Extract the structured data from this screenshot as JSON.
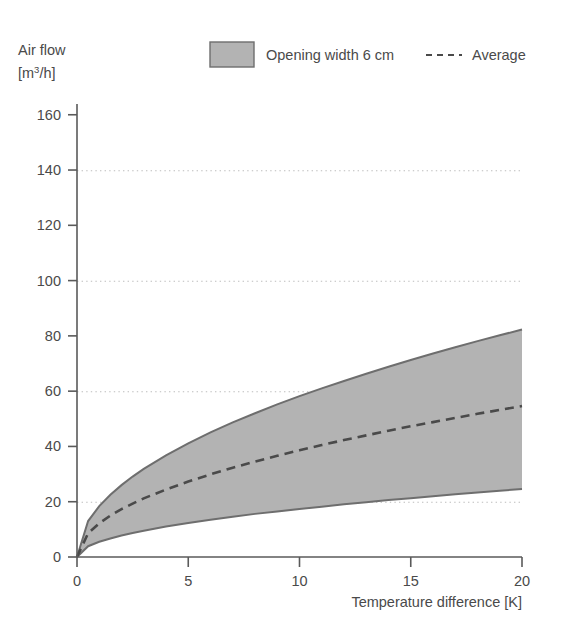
{
  "chart_data": {
    "type": "area",
    "title": "",
    "subtitle": "",
    "ylabel_line1": "Air flow",
    "ylabel_line2_pre": "[m",
    "ylabel_line2_sup": "3",
    "ylabel_line2_post": "/h]",
    "xlabel": "Temperature difference [K]",
    "xlim": [
      0,
      20
    ],
    "ylim": [
      0,
      160
    ],
    "xticks": [
      0,
      5,
      10,
      15,
      20
    ],
    "xtick_labels": [
      "0",
      "5",
      "10",
      "15",
      "20"
    ],
    "yticks": [
      0,
      20,
      40,
      60,
      80,
      100,
      120,
      140,
      160
    ],
    "ytick_labels": [
      "0",
      "20",
      "40",
      "60",
      "80",
      "100",
      "120",
      "140",
      "160"
    ],
    "gridlines_y": [
      20,
      60,
      100,
      140
    ],
    "grid": "horizontal-dotted",
    "legend_position": "top",
    "x": [
      0,
      0.5,
      1,
      1.5,
      2,
      2.5,
      3,
      4,
      5,
      6,
      7,
      8,
      9,
      10,
      11,
      12,
      13,
      14,
      15,
      16,
      17,
      18,
      19,
      20
    ],
    "series": [
      {
        "name": "Opening width 6 cm upper bound",
        "role": "band-upper",
        "color": "#6e6e6e",
        "values": [
          0,
          13.0,
          18.4,
          22.5,
          26.0,
          29.1,
          31.9,
          36.8,
          41.1,
          45.1,
          48.7,
          52.0,
          55.2,
          58.2,
          61.0,
          63.7,
          66.3,
          68.8,
          71.3,
          73.6,
          75.9,
          78.1,
          80.2,
          82.3
        ]
      },
      {
        "name": "Opening width 6 cm lower bound",
        "role": "band-lower",
        "color": "#6e6e6e",
        "values": [
          0,
          3.9,
          5.5,
          6.7,
          7.8,
          8.7,
          9.5,
          11.0,
          12.3,
          13.5,
          14.6,
          15.6,
          16.5,
          17.4,
          18.2,
          19.1,
          19.8,
          20.6,
          21.3,
          22.0,
          22.7,
          23.3,
          24.0,
          24.6
        ]
      },
      {
        "name": "Average",
        "role": "line-dashed",
        "color": "#4a4a4a",
        "values": [
          0,
          8.6,
          12.2,
          15.0,
          17.3,
          19.3,
          21.2,
          24.4,
          27.3,
          29.9,
          32.3,
          34.5,
          36.6,
          38.6,
          40.5,
          42.3,
          44.0,
          45.7,
          47.3,
          48.8,
          50.3,
          51.8,
          53.2,
          54.6
        ]
      }
    ],
    "legend": [
      {
        "label": "Opening width 6 cm",
        "marker": "filled-box",
        "color": "#b3b3b3",
        "border": "#6e6e6e"
      },
      {
        "label": "Average",
        "marker": "dashed-line",
        "color": "#4a4a4a"
      }
    ]
  }
}
